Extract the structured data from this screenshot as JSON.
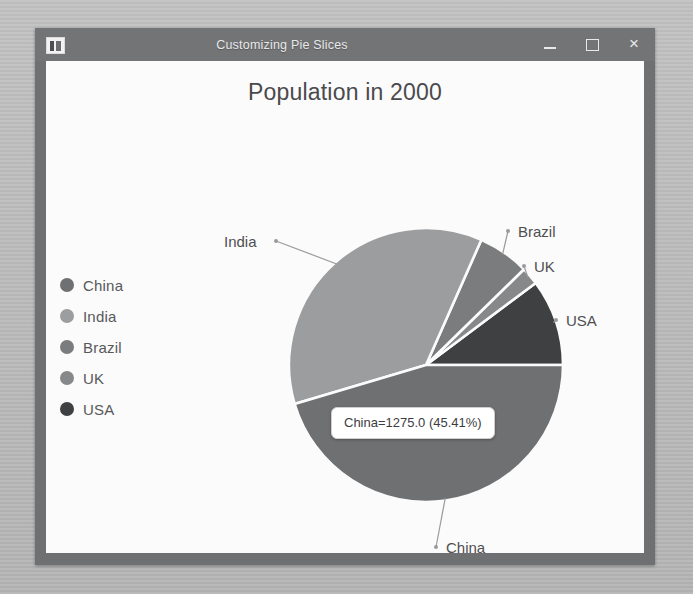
{
  "window": {
    "title": "Customizing Pie Slices",
    "icon": "app-icon",
    "controls": {
      "minimize": "minimize-icon",
      "maximize": "maximize-icon",
      "close": "close-icon",
      "close_glyph": "×"
    }
  },
  "chart_data": {
    "type": "pie",
    "title": "Population in 2000",
    "categories": [
      "China",
      "India",
      "Brazil",
      "UK",
      "USA"
    ],
    "values": [
      1275.0,
      1017.0,
      170.0,
      59.0,
      287.0
    ],
    "percents": [
      45.41,
      36.21,
      6.05,
      2.1,
      10.22
    ],
    "total": 2808.0,
    "unit": "millions",
    "start_angle_deg": 0,
    "direction": "counterclockwise",
    "colors": [
      "#6f7072",
      "#9c9d9f",
      "#7b7c7e",
      "#87888a",
      "#3f4042"
    ],
    "legend": {
      "position": "left",
      "entries": [
        {
          "label": "China",
          "color": "#6f7072"
        },
        {
          "label": "India",
          "color": "#9c9d9f"
        },
        {
          "label": "Brazil",
          "color": "#7b7c7e"
        },
        {
          "label": "UK",
          "color": "#87888a"
        },
        {
          "label": "USA",
          "color": "#3f4042"
        }
      ]
    },
    "slice_labels": [
      "India",
      "Brazil",
      "UK",
      "USA",
      "China"
    ],
    "annotation": {
      "text": "China=1275.0 (45.41%)",
      "slice": "China"
    },
    "grid": false,
    "xlabel": "",
    "ylabel": ""
  }
}
